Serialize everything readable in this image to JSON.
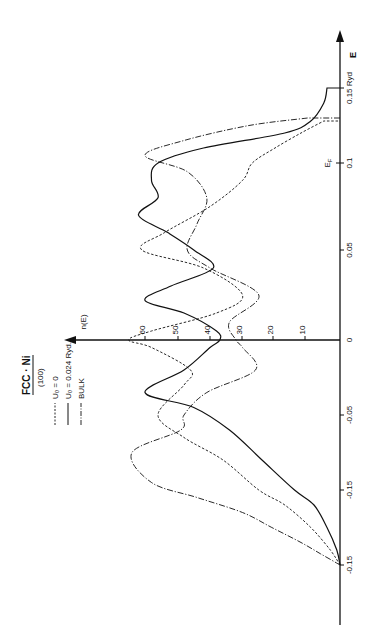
{
  "chart_data": {
    "type": "line",
    "orientation": "rotated-90-ccw",
    "title": "FCC · Ni",
    "subtitle": "(100)",
    "xlabel": "E",
    "x_unit": "Ryd",
    "ylabel": "n(E)",
    "x_ticks": [
      "-0.15",
      "-0.15",
      "-0.05",
      "0",
      "0.05",
      "0.1",
      "0.15 Ryd"
    ],
    "x_tick_values": [
      -0.2,
      -0.1,
      -0.05,
      0,
      0.05,
      0.1,
      0.15
    ],
    "fermi_label": "E_F",
    "fermi_energy": 0.1,
    "y_ticks": [
      "10",
      "20",
      "30",
      "40",
      "50",
      "60"
    ],
    "y_tick_values": [
      10,
      20,
      30,
      40,
      50,
      60
    ],
    "xlim": [
      -0.2,
      0.18
    ],
    "ylim": [
      0,
      70
    ],
    "grid": false,
    "legend_position": "top-left (rotated)",
    "series": [
      {
        "name": "U₀ = 0",
        "style": "dashed",
        "x": [
          -0.2,
          -0.18,
          -0.15,
          -0.12,
          -0.1,
          -0.08,
          -0.065,
          -0.05,
          -0.03,
          -0.02,
          -0.005,
          0,
          0.005,
          0.015,
          0.025,
          0.04,
          0.05,
          0.06,
          0.075,
          0.09,
          0.1,
          0.11,
          0.12,
          0.128
        ],
        "values": [
          0,
          3,
          9,
          17,
          25,
          36,
          48,
          56,
          48,
          46,
          58,
          65,
          58,
          38,
          30,
          42,
          61,
          54,
          40,
          30,
          27,
          20,
          12,
          5
        ]
      },
      {
        "name": "U₀ = 0.024 Ryd.",
        "style": "solid",
        "x": [
          -0.2,
          -0.18,
          -0.15,
          -0.12,
          -0.1,
          -0.08,
          -0.06,
          -0.045,
          -0.035,
          -0.02,
          -0.005,
          0,
          0.005,
          0.015,
          0.022,
          0.03,
          0.04,
          0.05,
          0.06,
          0.07,
          0.08,
          0.09,
          0.1,
          0.11,
          0.12,
          0.128,
          0.14,
          0.15
        ],
        "values": [
          0,
          1,
          4,
          8,
          14,
          24,
          34,
          45,
          60,
          48,
          40,
          37,
          38,
          48,
          60,
          52,
          39,
          45,
          53,
          62,
          56,
          58,
          56,
          42,
          17,
          9,
          5,
          4
        ]
      },
      {
        "name": "BULK",
        "style": "dash-dot",
        "x": [
          -0.2,
          -0.185,
          -0.17,
          -0.15,
          -0.13,
          -0.11,
          -0.095,
          -0.075,
          -0.06,
          -0.05,
          -0.035,
          -0.02,
          -0.005,
          0,
          0.01,
          0.025,
          0.04,
          0.05,
          0.065,
          0.08,
          0.095,
          0.105,
          0.115,
          0.125,
          0.13
        ],
        "values": [
          0,
          6,
          12,
          21,
          30,
          44,
          58,
          64,
          49,
          48,
          41,
          26,
          30,
          32,
          34,
          25,
          40,
          47,
          44,
          41,
          47,
          60,
          48,
          28,
          10
        ]
      }
    ]
  },
  "legend": {
    "title": "FCC · Ni",
    "subtitle": "(100)",
    "items": [
      {
        "label": "U₀ = 0",
        "style": "dashed"
      },
      {
        "label": "U₀ = 0.024 Ryd.",
        "style": "solid"
      },
      {
        "label": "BULK",
        "style": "dash-dot"
      }
    ]
  },
  "axes": {
    "e_axis_label": "E",
    "n_axis_label": "n(E)",
    "fermi_label": "E",
    "fermi_sub": "F",
    "e_ticks": [
      {
        "label": "0.15 Ryd",
        "y": 88
      },
      {
        "label": "0.1",
        "y": 163
      },
      {
        "label": "0.05",
        "y": 250
      },
      {
        "label": "0",
        "y": 340
      },
      {
        "label": "-0.05",
        "y": 415
      },
      {
        "label": "-0.15",
        "y": 490
      },
      {
        "label": "-0.15",
        "y": 565
      }
    ],
    "n_ticks": [
      {
        "label": "10",
        "x": 305
      },
      {
        "label": "20",
        "x": 273
      },
      {
        "label": "30",
        "x": 242
      },
      {
        "label": "40",
        "x": 210
      },
      {
        "label": "50",
        "x": 178
      },
      {
        "label": "60",
        "x": 145
      }
    ]
  },
  "colors": {
    "ink": "#111111",
    "background": "#ffffff"
  }
}
